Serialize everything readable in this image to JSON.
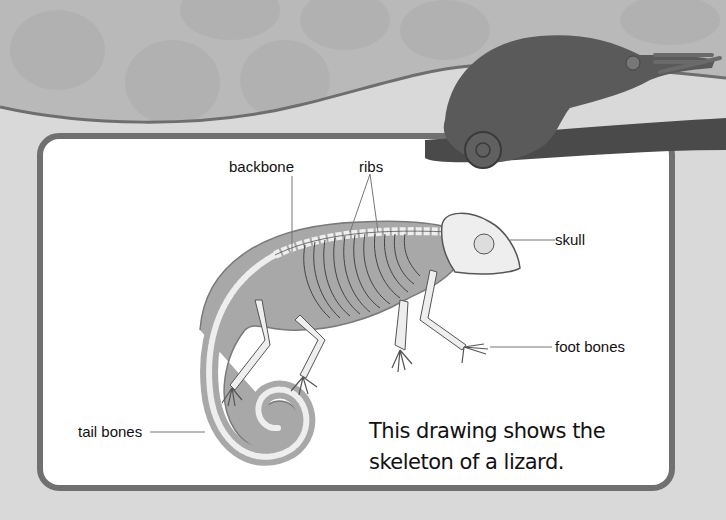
{
  "diagram": {
    "labels": {
      "backbone": "backbone",
      "ribs": "ribs",
      "skull": "skull",
      "foot_bones": "foot bones",
      "tail_bones": "tail bones"
    },
    "caption_line1": "This drawing shows the",
    "caption_line2": "skeleton of a lizard."
  },
  "photo": {
    "subject": "chameleon on branch"
  },
  "colors": {
    "panel_border": "#707070",
    "panel_bg": "#ffffff",
    "body_fill": "#a8a8a8",
    "bone_fill": "#eeeeee",
    "wave_line": "#6e6e6e"
  }
}
